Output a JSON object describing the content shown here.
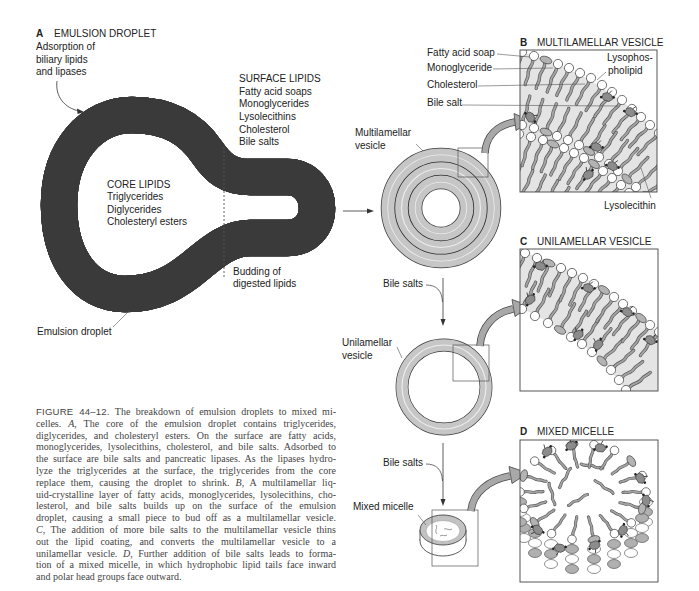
{
  "panel_a": {
    "letter": "A",
    "title": "EMULSION DROPLET",
    "adsorption_note": [
      "Adsorption of",
      "biliary lipids",
      "and lipases"
    ],
    "surface_lipids": {
      "heading": "SURFACE LIPIDS",
      "items": [
        "Fatty acid soaps",
        "Monoglycerides",
        "Lysolecithins",
        "Cholesterol",
        "Bile salts"
      ]
    },
    "core_lipids": {
      "heading": "CORE LIPIDS",
      "items": [
        "Triglycerides",
        "Diglycerides",
        "Cholesteryl esters"
      ]
    },
    "budding_note": [
      "Budding of",
      "digested lipids"
    ],
    "droplet_label": "Emulsion droplet"
  },
  "flow": {
    "multilamellar_label": [
      "Multilamellar",
      "vesicle"
    ],
    "bile_salts_1": "Bile salts",
    "unilamellar_label": [
      "Unilamellar",
      "vesicle"
    ],
    "bile_salts_2": "Bile salts",
    "mixed_micelle_label": "Mixed micelle"
  },
  "panel_b": {
    "letter": "B",
    "title": "MULTILAMELLAR VESICLE",
    "labels": {
      "fatty_acid_soap": "Fatty acid soap",
      "monoglyceride": "Monoglyceride",
      "cholesterol": "Cholesterol",
      "bile_salt": "Bile salt",
      "lysophospholipid": [
        "Lysophos-",
        "pholipid"
      ],
      "lysolecithin": "Lysolecithin"
    }
  },
  "panel_c": {
    "letter": "C",
    "title": "UNILAMELLAR VESICLE"
  },
  "panel_d": {
    "letter": "D",
    "title": "MIXED MICELLE"
  },
  "caption": {
    "figure_label": "FIGURE 44–12.",
    "lines": [
      {
        "pre": " The breakdown of emulsion droplets to mixed mi-"
      },
      {
        "pre": "celles. ",
        "em": "A",
        "post": ", The core of the emulsion droplet contains triglycerides,"
      },
      {
        "pre": "diglycerides, and cholesteryl esters. On the surface are fatty acids,"
      },
      {
        "pre": "monoglycerides, lysolecithins, cholesterol, and bile salts. Adsorbed to"
      },
      {
        "pre": "the surface are bile salts and pancreatic lipases. As the lipases hydro-"
      },
      {
        "pre": "lyze the triglycerides at the surface, the triglycerides from the core"
      },
      {
        "pre": "replace them, causing the droplet to shrink. ",
        "em": "B",
        "post": ", A multilamellar liq-"
      },
      {
        "pre": "uid-crystalline layer of fatty acids, monoglycerides, lysolecithins, cho-"
      },
      {
        "pre": "lesterol, and bile salts builds up on the surface of the emulsion"
      },
      {
        "pre": "droplet, causing a small piece to bud off as a multilamellar vesicle."
      },
      {
        "pre": "",
        "em": "C",
        "post": ", The addition of more bile salts to the multilamellar vesicle thins"
      },
      {
        "pre": "out the lipid coating, and converts the multilamellar vesicle to a"
      },
      {
        "pre": "unilamellar vesicle. ",
        "em": "D",
        "post": ", Further addition of bile salts leads to forma-"
      },
      {
        "pre": "tion of a mixed micelle, in which hydrophobic lipid tails face inward"
      },
      {
        "pre": "and polar head groups face outward."
      }
    ]
  },
  "colors": {
    "band_gray": "#c6c6c6",
    "band_highlight": "#ececec",
    "membrane_line": "#2a2a2a",
    "arrow_gray": "#a8a8a8",
    "bilayer_fill": "#e4e4e4",
    "label_text": "#222222",
    "caption_text": "#444444"
  }
}
